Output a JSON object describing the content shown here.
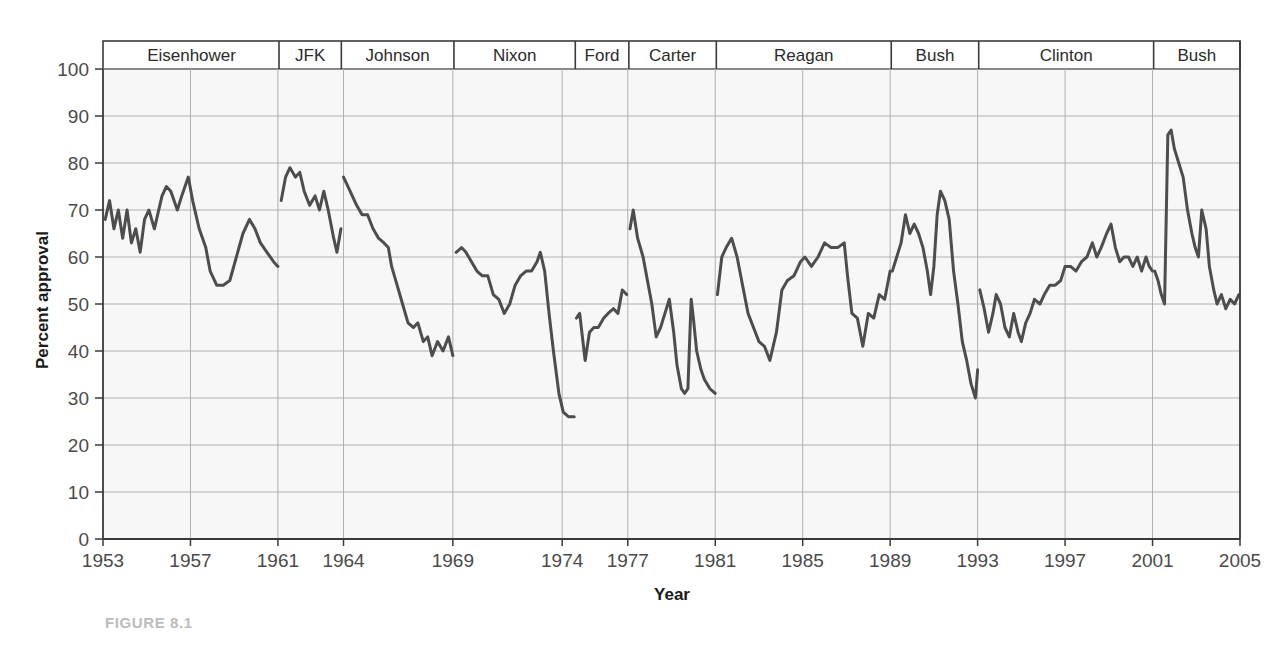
{
  "figure": {
    "caption": "FIGURE 8.1"
  },
  "chart_data": {
    "type": "line",
    "title": "",
    "xlabel": "Year",
    "ylabel": "Percent approval",
    "xlim": [
      1953,
      2005
    ],
    "ylim": [
      0,
      100
    ],
    "grid": true,
    "legend_position": "none",
    "line_color": "#4d4d4d",
    "grid_color": "#b0b0b0",
    "plot_background": "#f7f7f7",
    "y_ticks": [
      0,
      10,
      20,
      30,
      40,
      50,
      60,
      70,
      80,
      90,
      100
    ],
    "x_ticks": [
      1953,
      1957,
      1961,
      1964,
      1969,
      1974,
      1977,
      1981,
      1985,
      1989,
      1993,
      1997,
      2001,
      2005
    ],
    "x_tick_labels": [
      "1953",
      "1957",
      "1961",
      "1964",
      "1969",
      "1974",
      "1977",
      "1981",
      "1985",
      "1989",
      "1993",
      "1997",
      "2001",
      "2005"
    ],
    "administrations": [
      {
        "name": "Eisenhower",
        "start": 1953.05,
        "end": 1961.05
      },
      {
        "name": "JFK",
        "start": 1961.05,
        "end": 1963.9
      },
      {
        "name": "Johnson",
        "start": 1963.9,
        "end": 1969.05
      },
      {
        "name": "Nixon",
        "start": 1969.05,
        "end": 1974.6
      },
      {
        "name": "Ford",
        "start": 1974.6,
        "end": 1977.05
      },
      {
        "name": "Carter",
        "start": 1977.05,
        "end": 1981.05
      },
      {
        "name": "Reagan",
        "start": 1981.05,
        "end": 1989.05
      },
      {
        "name": "Bush",
        "start": 1989.05,
        "end": 1993.05
      },
      {
        "name": "Clinton",
        "start": 1993.05,
        "end": 2001.05
      },
      {
        "name": "Bush",
        "start": 2001.05,
        "end": 2005.0
      }
    ],
    "series": [
      {
        "name": "Eisenhower",
        "points": [
          [
            1953.1,
            68
          ],
          [
            1953.3,
            72
          ],
          [
            1953.5,
            66
          ],
          [
            1953.7,
            70
          ],
          [
            1953.9,
            64
          ],
          [
            1954.1,
            70
          ],
          [
            1954.3,
            63
          ],
          [
            1954.5,
            66
          ],
          [
            1954.7,
            61
          ],
          [
            1954.9,
            68
          ],
          [
            1955.1,
            70
          ],
          [
            1955.35,
            66
          ],
          [
            1955.5,
            69
          ],
          [
            1955.7,
            73
          ],
          [
            1955.9,
            75
          ],
          [
            1956.1,
            74
          ],
          [
            1956.4,
            70
          ],
          [
            1956.6,
            73
          ],
          [
            1956.9,
            77
          ],
          [
            1957.1,
            72
          ],
          [
            1957.4,
            66
          ],
          [
            1957.7,
            62
          ],
          [
            1957.9,
            57
          ],
          [
            1958.2,
            54
          ],
          [
            1958.5,
            54
          ],
          [
            1958.8,
            55
          ],
          [
            1959.1,
            60
          ],
          [
            1959.4,
            65
          ],
          [
            1959.7,
            68
          ],
          [
            1959.95,
            66
          ],
          [
            1960.2,
            63
          ],
          [
            1960.5,
            61
          ],
          [
            1960.8,
            59
          ],
          [
            1961.0,
            58
          ]
        ]
      },
      {
        "name": "JFK",
        "points": [
          [
            1961.15,
            72
          ],
          [
            1961.35,
            77
          ],
          [
            1961.55,
            79
          ],
          [
            1961.8,
            77
          ],
          [
            1962.0,
            78
          ],
          [
            1962.2,
            74
          ],
          [
            1962.45,
            71
          ],
          [
            1962.7,
            73
          ],
          [
            1962.9,
            70
          ],
          [
            1963.1,
            74
          ],
          [
            1963.3,
            70
          ],
          [
            1963.55,
            64
          ],
          [
            1963.7,
            61
          ],
          [
            1963.88,
            66
          ]
        ]
      },
      {
        "name": "Johnson",
        "points": [
          [
            1964.0,
            77
          ],
          [
            1964.3,
            74
          ],
          [
            1964.6,
            71
          ],
          [
            1964.85,
            69
          ],
          [
            1965.1,
            69
          ],
          [
            1965.35,
            66
          ],
          [
            1965.6,
            64
          ],
          [
            1965.85,
            63
          ],
          [
            1966.05,
            62
          ],
          [
            1966.2,
            58
          ],
          [
            1966.45,
            54
          ],
          [
            1966.7,
            50
          ],
          [
            1966.95,
            46
          ],
          [
            1967.2,
            45
          ],
          [
            1967.4,
            46
          ],
          [
            1967.65,
            42
          ],
          [
            1967.85,
            43
          ],
          [
            1968.05,
            39
          ],
          [
            1968.3,
            42
          ],
          [
            1968.55,
            40
          ],
          [
            1968.8,
            43
          ],
          [
            1969.0,
            39
          ]
        ]
      },
      {
        "name": "Nixon",
        "points": [
          [
            1969.15,
            61
          ],
          [
            1969.4,
            62
          ],
          [
            1969.6,
            61
          ],
          [
            1969.85,
            59
          ],
          [
            1970.1,
            57
          ],
          [
            1970.35,
            56
          ],
          [
            1970.6,
            56
          ],
          [
            1970.85,
            52
          ],
          [
            1971.1,
            51
          ],
          [
            1971.35,
            48
          ],
          [
            1971.6,
            50
          ],
          [
            1971.85,
            54
          ],
          [
            1972.1,
            56
          ],
          [
            1972.35,
            57
          ],
          [
            1972.6,
            57
          ],
          [
            1972.85,
            59
          ],
          [
            1973.0,
            61
          ],
          [
            1973.2,
            57
          ],
          [
            1973.4,
            48
          ],
          [
            1973.6,
            40
          ],
          [
            1973.85,
            31
          ],
          [
            1974.05,
            27
          ],
          [
            1974.3,
            26
          ],
          [
            1974.55,
            26
          ]
        ]
      },
      {
        "name": "Ford",
        "points": [
          [
            1974.65,
            47
          ],
          [
            1974.8,
            48
          ],
          [
            1974.95,
            42
          ],
          [
            1975.05,
            38
          ],
          [
            1975.25,
            44
          ],
          [
            1975.45,
            45
          ],
          [
            1975.65,
            45
          ],
          [
            1975.9,
            47
          ],
          [
            1976.1,
            48
          ],
          [
            1976.35,
            49
          ],
          [
            1976.55,
            48
          ],
          [
            1976.75,
            53
          ],
          [
            1976.95,
            52
          ]
        ]
      },
      {
        "name": "Carter",
        "points": [
          [
            1977.1,
            66
          ],
          [
            1977.25,
            70
          ],
          [
            1977.45,
            64
          ],
          [
            1977.7,
            60
          ],
          [
            1977.9,
            55
          ],
          [
            1978.1,
            50
          ],
          [
            1978.3,
            43
          ],
          [
            1978.5,
            45
          ],
          [
            1978.7,
            48
          ],
          [
            1978.9,
            51
          ],
          [
            1979.1,
            44
          ],
          [
            1979.25,
            37
          ],
          [
            1979.45,
            32
          ],
          [
            1979.6,
            31
          ],
          [
            1979.75,
            32
          ],
          [
            1979.9,
            51
          ],
          [
            1980.0,
            47
          ],
          [
            1980.15,
            40
          ],
          [
            1980.35,
            36
          ],
          [
            1980.5,
            34
          ],
          [
            1980.75,
            32
          ],
          [
            1981.0,
            31
          ]
        ]
      },
      {
        "name": "Reagan",
        "points": [
          [
            1981.1,
            52
          ],
          [
            1981.3,
            60
          ],
          [
            1981.5,
            62
          ],
          [
            1981.75,
            64
          ],
          [
            1982.0,
            60
          ],
          [
            1982.25,
            54
          ],
          [
            1982.5,
            48
          ],
          [
            1982.75,
            45
          ],
          [
            1983.0,
            42
          ],
          [
            1983.25,
            41
          ],
          [
            1983.5,
            38
          ],
          [
            1983.8,
            44
          ],
          [
            1984.05,
            53
          ],
          [
            1984.3,
            55
          ],
          [
            1984.6,
            56
          ],
          [
            1984.9,
            59
          ],
          [
            1985.1,
            60
          ],
          [
            1985.4,
            58
          ],
          [
            1985.7,
            60
          ],
          [
            1986.0,
            63
          ],
          [
            1986.3,
            62
          ],
          [
            1986.6,
            62
          ],
          [
            1986.9,
            63
          ],
          [
            1987.05,
            56
          ],
          [
            1987.25,
            48
          ],
          [
            1987.5,
            47
          ],
          [
            1987.75,
            41
          ],
          [
            1988.0,
            48
          ],
          [
            1988.25,
            47
          ],
          [
            1988.5,
            52
          ],
          [
            1988.75,
            51
          ],
          [
            1989.0,
            57
          ]
        ]
      },
      {
        "name": "Bush",
        "points": [
          [
            1989.1,
            57
          ],
          [
            1989.3,
            60
          ],
          [
            1989.5,
            63
          ],
          [
            1989.7,
            69
          ],
          [
            1989.9,
            65
          ],
          [
            1990.1,
            67
          ],
          [
            1990.3,
            65
          ],
          [
            1990.5,
            62
          ],
          [
            1990.7,
            57
          ],
          [
            1990.85,
            52
          ],
          [
            1991.0,
            58
          ],
          [
            1991.15,
            69
          ],
          [
            1991.3,
            74
          ],
          [
            1991.5,
            72
          ],
          [
            1991.7,
            68
          ],
          [
            1991.9,
            57
          ],
          [
            1992.1,
            50
          ],
          [
            1992.3,
            42
          ],
          [
            1992.5,
            38
          ],
          [
            1992.7,
            33
          ],
          [
            1992.9,
            30
          ],
          [
            1993.0,
            36
          ]
        ]
      },
      {
        "name": "Clinton",
        "points": [
          [
            1993.1,
            53
          ],
          [
            1993.3,
            49
          ],
          [
            1993.5,
            44
          ],
          [
            1993.7,
            48
          ],
          [
            1993.85,
            52
          ],
          [
            1994.05,
            50
          ],
          [
            1994.25,
            45
          ],
          [
            1994.45,
            43
          ],
          [
            1994.65,
            48
          ],
          [
            1994.85,
            44
          ],
          [
            1995.0,
            42
          ],
          [
            1995.2,
            46
          ],
          [
            1995.4,
            48
          ],
          [
            1995.6,
            51
          ],
          [
            1995.85,
            50
          ],
          [
            1996.05,
            52
          ],
          [
            1996.3,
            54
          ],
          [
            1996.55,
            54
          ],
          [
            1996.8,
            55
          ],
          [
            1997.0,
            58
          ],
          [
            1997.25,
            58
          ],
          [
            1997.5,
            57
          ],
          [
            1997.75,
            59
          ],
          [
            1998.0,
            60
          ],
          [
            1998.25,
            63
          ],
          [
            1998.45,
            60
          ],
          [
            1998.65,
            62
          ],
          [
            1998.9,
            65
          ],
          [
            1999.1,
            67
          ],
          [
            1999.3,
            62
          ],
          [
            1999.5,
            59
          ],
          [
            1999.7,
            60
          ],
          [
            1999.9,
            60
          ],
          [
            2000.1,
            58
          ],
          [
            2000.3,
            60
          ],
          [
            2000.5,
            57
          ],
          [
            2000.7,
            60
          ],
          [
            2000.85,
            58
          ],
          [
            2001.0,
            57
          ]
        ]
      },
      {
        "name": "Bush 2",
        "points": [
          [
            2001.1,
            57
          ],
          [
            2001.25,
            55
          ],
          [
            2001.4,
            52
          ],
          [
            2001.55,
            50
          ],
          [
            2001.7,
            86
          ],
          [
            2001.85,
            87
          ],
          [
            2002.0,
            83
          ],
          [
            2002.2,
            80
          ],
          [
            2002.4,
            77
          ],
          [
            2002.6,
            70
          ],
          [
            2002.8,
            65
          ],
          [
            2002.95,
            62
          ],
          [
            2003.1,
            60
          ],
          [
            2003.25,
            70
          ],
          [
            2003.45,
            66
          ],
          [
            2003.6,
            58
          ],
          [
            2003.8,
            53
          ],
          [
            2003.95,
            50
          ],
          [
            2004.15,
            52
          ],
          [
            2004.35,
            49
          ],
          [
            2004.55,
            51
          ],
          [
            2004.75,
            50
          ],
          [
            2004.95,
            52
          ]
        ]
      }
    ]
  }
}
